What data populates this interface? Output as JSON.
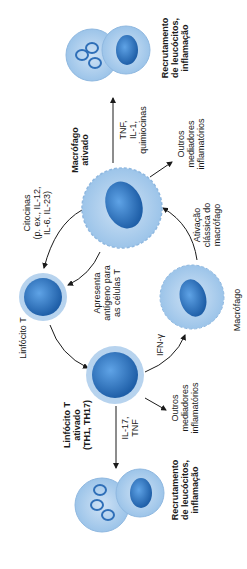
{
  "orientation": "rotated -90deg",
  "colors": {
    "cell_outer": "#b7d3ee",
    "cell_mid": "#8fbde6",
    "nucleus": "#2f7ed0",
    "nucleus_dark": "#1f5fa8",
    "arrow": "#1a1a1a",
    "text": "#1a1a1a"
  },
  "nodes": {
    "macrofago_ativado": {
      "label_line1": "Macrófago",
      "label_line2": "ativado"
    },
    "linfocito_t": {
      "label": "Linfócito T"
    },
    "linfocito_t_ativado": {
      "label_line1": "Linfócito T",
      "label_line2": "ativado",
      "label_line3": "(TH1, TH17)"
    },
    "macrofago": {
      "label": "Macrófago"
    },
    "recrutamento_top": {
      "label_line1": "Recrutamento",
      "label_line2": "de leucócitos,",
      "label_line3": "inflamação"
    },
    "recrutamento_bottom": {
      "label_line1": "Recrutamento",
      "label_line2": "de leucócitos,",
      "label_line3": "inflamação"
    }
  },
  "edges": {
    "citocinas": {
      "line1": "Citocinas",
      "line2": "(p. ex., IL-12,",
      "line3": "IL-6, IL-23)"
    },
    "tnf_il1": {
      "line1": "TNF,",
      "line2": "IL-1,",
      "line3": "quimiocinas"
    },
    "outros_top": {
      "line1": "Outros",
      "line2": "mediadores",
      "line3": "inflamatórios"
    },
    "apresenta": {
      "line1": "Apresenta",
      "line2": "antígeno para",
      "line3": "as células T"
    },
    "ativacao": {
      "line1": "Ativação",
      "line2": "clássica do",
      "line3": "macrófago"
    },
    "ifn": {
      "label": "IFN-γ"
    },
    "il17": {
      "line1": "IL-17,",
      "line2": "TNF"
    },
    "outros_bottom": {
      "line1": "Outros",
      "line2": "mediadores",
      "line3": "inflamatórios"
    }
  }
}
